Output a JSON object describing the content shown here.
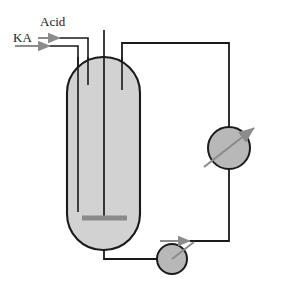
{
  "figure": {
    "type": "process-flow-diagram"
  },
  "labels": {
    "acid": "Acid",
    "ka": "KA"
  },
  "colors": {
    "vessel_fill": "#d2d2d2",
    "vessel_stroke": "#1a1a1a",
    "circle_fill": "#b8b8b8",
    "circle_stroke": "#1a1a1a",
    "pipe_stroke": "#1a1a1a",
    "arrow_gray": "#8c8c8c",
    "impeller_gray": "#8a8a8a",
    "background": "#ffffff",
    "text": "#1a1a1a"
  },
  "components": {
    "vessel": {
      "name": "Loop reactor vessel",
      "shape": "capsule",
      "x": 67,
      "y": 57,
      "width": 73,
      "height": 193,
      "corner_radius": 36
    },
    "heat_exchanger": {
      "name": "Heat exchanger",
      "shape": "circle",
      "cx": 229,
      "cy": 148,
      "r": 21
    },
    "pump": {
      "name": "Circulation pump",
      "shape": "circle",
      "cx": 172,
      "cy": 259,
      "r": 15
    },
    "impeller": {
      "name": "Impeller bar",
      "x1": 82,
      "y1": 218,
      "x2": 127,
      "y2": 218,
      "thickness": 5
    },
    "shaft": {
      "name": "Central shaft",
      "x": 104,
      "y_top": 30,
      "y_bottom": 218
    },
    "acid_dip_tube": {
      "name": "Acid dip tube",
      "x": 88,
      "y_top": 57,
      "y_bottom": 85
    },
    "ka_dip_tube": {
      "name": "KA dip tube",
      "x": 78,
      "y_top": 57,
      "y_bottom": 212
    },
    "vent_tube": {
      "name": "Vent / draft tube",
      "x": 122,
      "y_top": 43,
      "y_bottom": 90
    }
  },
  "streams": [
    {
      "name": "acid-feed",
      "label": "Acid",
      "direction": "into-vessel"
    },
    {
      "name": "ka-feed",
      "label": "KA",
      "direction": "into-vessel"
    },
    {
      "name": "overhead-to-exchanger",
      "label": "",
      "direction": "right"
    },
    {
      "name": "exchanger-to-pump",
      "label": "",
      "direction": "down-left"
    },
    {
      "name": "vessel-bottom-to-pump",
      "label": "",
      "direction": "right"
    },
    {
      "name": "pump-to-exchanger",
      "label": "",
      "direction": "up-right"
    }
  ],
  "arrows": {
    "acid_inlet": {
      "x1": 38,
      "y1": 38,
      "x2": 60,
      "y2": 38
    },
    "ka_inlet": {
      "x1": 15,
      "y1": 46,
      "x2": 48,
      "y2": 46
    },
    "exchanger_diagonal": {
      "x1": 204,
      "y1": 167,
      "x2": 256,
      "y2": 127
    },
    "pump_discharge": {
      "x1": 172,
      "y1": 259,
      "x2": 196,
      "y2": 241
    }
  }
}
